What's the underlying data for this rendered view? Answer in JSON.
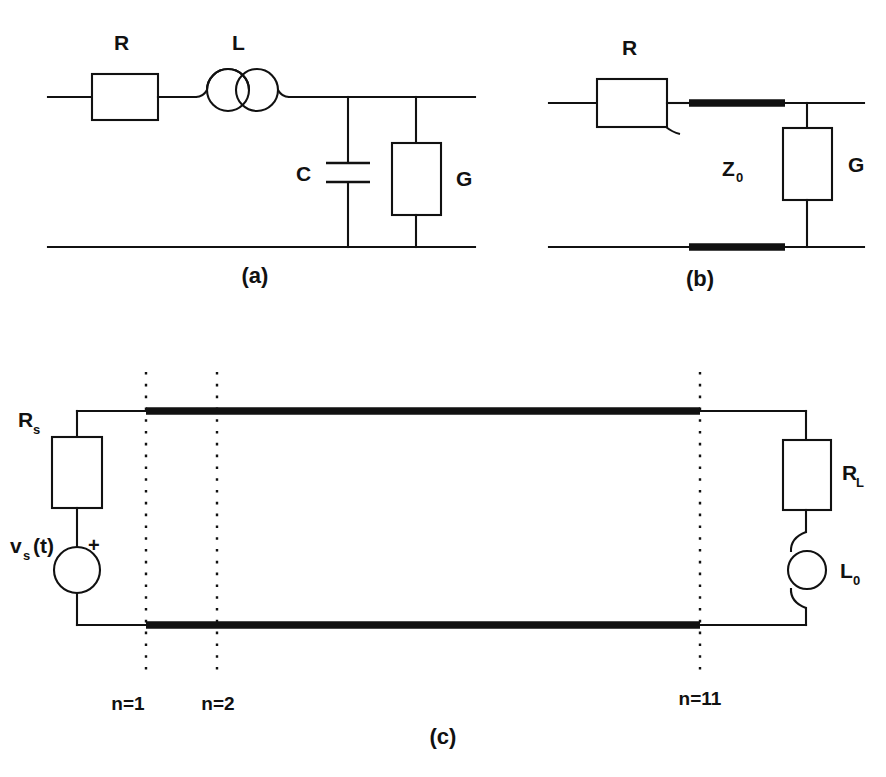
{
  "figure": {
    "background_color": "#ffffff",
    "line_color": "#111111"
  },
  "panels": [
    {
      "id": "a",
      "caption": "(a)",
      "description": "Lumped-element RLCG transmission line unit cell",
      "components": [
        {
          "name": "series-resistor",
          "label": "R",
          "type": "resistor"
        },
        {
          "name": "series-inductor",
          "label": "L",
          "type": "inductor"
        },
        {
          "name": "shunt-capacitor",
          "label": "C",
          "type": "capacitor"
        },
        {
          "name": "shunt-conductance",
          "label": "G",
          "type": "resistor"
        }
      ]
    },
    {
      "id": "b",
      "caption": "(b)",
      "description": "Equivalent model with characteristic impedance transmission line",
      "components": [
        {
          "name": "series-resistor",
          "label": "R",
          "type": "resistor"
        },
        {
          "name": "transmission-line",
          "label": "Z",
          "sub": "0",
          "type": "tline"
        },
        {
          "name": "shunt-conductance",
          "label": "G",
          "type": "resistor"
        }
      ]
    },
    {
      "id": "c",
      "caption": "(c)",
      "description": "Full cascaded transmission line with source and load",
      "components": [
        {
          "name": "source-resistor",
          "label": "R",
          "sub": "s",
          "type": "resistor"
        },
        {
          "name": "voltage-source",
          "label": "v",
          "sub": "s",
          "suffix": " (t)",
          "type": "source"
        },
        {
          "name": "source-polarity",
          "label": "+",
          "type": "polarity"
        },
        {
          "name": "load-resistor",
          "label": "R",
          "sub": "L",
          "type": "resistor"
        },
        {
          "name": "load-inductor",
          "label": "L",
          "sub": "0",
          "type": "inductor"
        }
      ],
      "node_markers": [
        {
          "name": "node-marker-n1",
          "label": "n=1",
          "x": 146
        },
        {
          "name": "node-marker-n2",
          "label": "n=2",
          "x": 217
        },
        {
          "name": "node-marker-n11",
          "label": "n=11",
          "x": 700
        }
      ]
    }
  ],
  "labels": {
    "panel_a": {
      "R": "R",
      "L": "L",
      "C": "C",
      "G": "G",
      "caption": "(a)"
    },
    "panel_b": {
      "R": "R",
      "Z0_main": "Z",
      "Z0_sub": "0",
      "G": "G",
      "caption": "(b)"
    },
    "panel_c": {
      "Rs_main": "R",
      "Rs_sub": "s",
      "vs_main": "v",
      "vs_sub": "s",
      "vs_suffix": "(t)",
      "plus": "+",
      "RL_main": "R",
      "RL_sub": "L",
      "L0_main": "L",
      "L0_sub": "0",
      "n1": "n=1",
      "n2": "n=2",
      "n11": "n=11",
      "caption": "(c)"
    }
  }
}
